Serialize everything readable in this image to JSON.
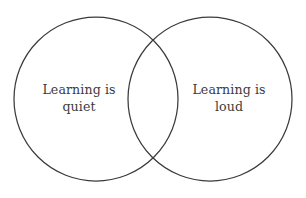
{
  "figure": {
    "type": "venn-diagram",
    "title": "",
    "background_color": "#ffffff",
    "stroke_color": "#3b3b3b",
    "text_color": "#3b3b3b",
    "width": 306,
    "height": 198
  },
  "chart_data": {
    "type": "venn",
    "title": "",
    "sets": [
      {
        "id": "left",
        "label_lines": [
          "Learning is",
          "quiet"
        ],
        "label_text": "Learning is quiet",
        "center_x": 96,
        "center_y": 99,
        "radius": 82,
        "fill": "none",
        "stroke": "#3b3b3b"
      },
      {
        "id": "right",
        "label_lines": [
          "Learning is",
          "loud"
        ],
        "label_text": "Learning is loud",
        "center_x": 210,
        "center_y": 99,
        "radius": 82,
        "fill": "none",
        "stroke": "#3b3b3b"
      }
    ],
    "intersection": {
      "label_text": "",
      "top_point": [
        153,
        28
      ],
      "bottom_point": [
        153,
        170
      ]
    },
    "legend": [],
    "annotations": []
  },
  "left_circle": {
    "line_1": "Learning is",
    "line_2": "quiet"
  },
  "right_circle": {
    "line_1": "Learning is",
    "line_2": "loud"
  }
}
